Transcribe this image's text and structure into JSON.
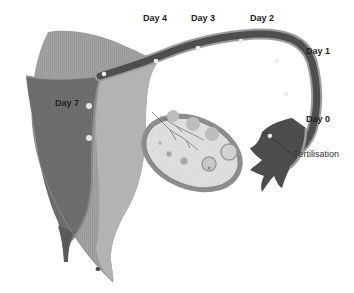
{
  "diagram": {
    "colors": {
      "uterus_wall": "#a3a3a3",
      "uterus_wall_light": "#b4b4b4",
      "uterine_cavity": "#6f6f6f",
      "tube_lumen": "#4d4d4d",
      "tube_wall": "#9b9b9b",
      "ovary_fill": "#e3e3e3",
      "ovary_rim": "#8f8f8f",
      "follicle": "#b8b8b8",
      "embryo_dot": "#f2f2f2"
    },
    "labels": {
      "day0": "Day 0",
      "day1": "Day 1",
      "day2": "Day 2",
      "day3": "Day 3",
      "day4": "Day 4",
      "day7": "Day 7",
      "fertilisation": "Fertilisation"
    },
    "stages": [
      {
        "label": "Day 0",
        "event": "Fertilisation",
        "location": "ampulla of fallopian tube"
      },
      {
        "label": "Day 1",
        "location": "fallopian tube"
      },
      {
        "label": "Day 2",
        "location": "fallopian tube"
      },
      {
        "label": "Day 3",
        "location": "fallopian tube"
      },
      {
        "label": "Day 4",
        "location": "fallopian tube near uterus"
      },
      {
        "label": "Day 7",
        "location": "uterine wall (implantation)"
      }
    ]
  }
}
